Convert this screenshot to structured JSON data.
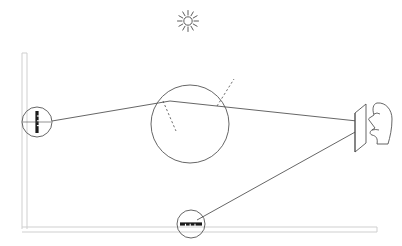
{
  "diagram": {
    "background_color": "#ffffff",
    "stroke_color": "#4a4a4a",
    "structure_color": "#cfcfcf",
    "dark_element_color": "#1a1a1a",
    "width": 402,
    "height": 246
  },
  "elements": {
    "sun": {
      "name": "sun-icon",
      "label": "sun",
      "cx": 188,
      "cy": 21,
      "core_radius": 4.2,
      "ray_count": 12,
      "ray_inner": 6,
      "ray_outer": 10.5
    },
    "wall": {
      "name": "vertical-wall",
      "label": "wall",
      "x": 22,
      "y_top": 53,
      "y_bottom": 229,
      "thickness": 5
    },
    "ground": {
      "name": "ground-line",
      "label": "ground",
      "y": 227,
      "x_left": 22,
      "x_right": 377,
      "thickness": 5
    },
    "wall_device": {
      "name": "wall-mounted-mirror-device",
      "label": "wall mirror",
      "cx": 37,
      "cy": 122,
      "radius": 15,
      "bar_half_height": 11,
      "bar_width": 3.2
    },
    "lens_circle": {
      "name": "spherical-lens",
      "label": "sphere",
      "cx": 190,
      "cy": 124,
      "radius": 39
    },
    "normal_left": {
      "name": "normal-line-left",
      "label": "normal (entry)",
      "x1": 163,
      "y1": 101,
      "x2": 176,
      "y2": 131
    },
    "normal_right": {
      "name": "normal-line-right",
      "label": "normal (exit)",
      "x1": 217,
      "y1": 106,
      "x2": 234,
      "y2": 79
    },
    "screen_plate": {
      "name": "projection-screen-plate",
      "label": "screen",
      "front_x": 355,
      "back_x": 366,
      "front_top": 113,
      "front_bottom": 152,
      "back_top": 104,
      "back_bottom": 143
    },
    "observer": {
      "name": "observer-face-profile",
      "label": "observer",
      "x": 373,
      "y": 103
    },
    "ground_device": {
      "name": "ground-mounted-mirror-device",
      "label": "ground mirror",
      "cx": 191,
      "cy": 224,
      "radius": 14,
      "bar_half_width": 11,
      "bar_height": 3.2
    }
  },
  "rays": [
    {
      "name": "ray-wall-to-sphere",
      "label": "incident ray",
      "x1": 52,
      "y1": 121,
      "x2": 170,
      "y2": 101
    },
    {
      "name": "ray-sphere-to-screen",
      "label": "refracted ray to screen",
      "x1": 170,
      "y1": 101,
      "x2": 357,
      "y2": 121
    },
    {
      "name": "ray-ground-to-screen",
      "label": "ray from ground mirror to screen",
      "x1": 197,
      "y1": 220,
      "x2": 357,
      "y2": 131
    }
  ]
}
